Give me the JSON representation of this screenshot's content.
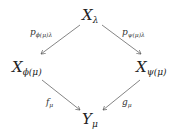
{
  "diagram": {
    "type": "commutative-diagram",
    "nodes": {
      "top": {
        "base": "X",
        "sub": "λ"
      },
      "left": {
        "base": "X",
        "sub": "ϕ(μ)"
      },
      "right": {
        "base": "X",
        "sub": "ψ(μ)"
      },
      "bottom": {
        "base": "Y",
        "sub": "μ"
      }
    },
    "edges": {
      "top_left": {
        "base": "p",
        "sub": "ϕ(μ)λ",
        "from": "top",
        "to": "left"
      },
      "top_right": {
        "base": "p",
        "sub": "ψ(μ)λ",
        "from": "top",
        "to": "right"
      },
      "left_bottom": {
        "base": "f",
        "sub": "μ",
        "from": "left",
        "to": "bottom"
      },
      "right_bottom": {
        "base": "g",
        "sub": "μ",
        "from": "right",
        "to": "bottom"
      }
    }
  }
}
